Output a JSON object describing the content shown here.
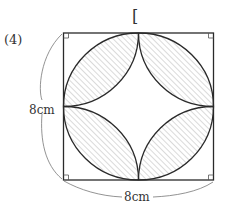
{
  "problem": {
    "number_label": "(4)",
    "bracket": "["
  },
  "figure": {
    "shape": "square with inscribed circle and four quarter-circle arcs centered at corners",
    "side_label_left": "8cm",
    "side_label_bottom": "8cm",
    "right_angle_marks": 4,
    "shaded_regions": 4,
    "colors": {
      "stroke": "#2a2a2a",
      "hatch": "#b0b0b0",
      "label": "#333333"
    }
  }
}
